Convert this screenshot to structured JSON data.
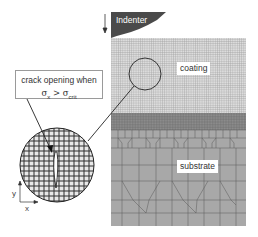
{
  "figure": {
    "indenter": {
      "label": "Indenter",
      "color": "#4a4a4a"
    },
    "layers": {
      "coating": {
        "label": "coating",
        "mesh_color": "#9c9c9c",
        "fill": "#d6d6d6"
      },
      "substrate": {
        "label": "substrate",
        "mesh_color": "#555555",
        "fill": "#a9a9a9"
      }
    },
    "callout": {
      "line1": "crack opening when",
      "sigma_x": "σ",
      "sigma_x_sub": "x",
      "operator": ">",
      "sigma_crit": "σ",
      "sigma_crit_sub": "crit"
    },
    "axes": {
      "y_label": "y",
      "x_label": "x"
    },
    "arrows": {
      "load_direction": "down"
    }
  }
}
